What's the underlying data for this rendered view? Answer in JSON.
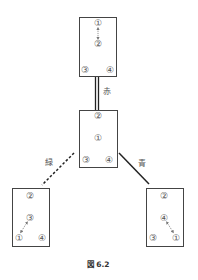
{
  "diagram": {
    "caption": "図 6.2",
    "boxes": {
      "top": {
        "n1": "①",
        "n2": "②",
        "n3": "③",
        "n4": "④"
      },
      "middle": {
        "n1": "①",
        "n2": "②",
        "n3": "③",
        "n4": "④"
      },
      "left": {
        "n1": "①",
        "n2": "②",
        "n3": "③",
        "n4": "④"
      },
      "right": {
        "n1": "①",
        "n2": "②",
        "n3": "③",
        "n4": "④"
      }
    },
    "edges": {
      "top_middle": {
        "label": "赤",
        "style": "double"
      },
      "middle_left": {
        "label": "緑",
        "style": "dashed"
      },
      "middle_right": {
        "label": "青",
        "style": "solid"
      }
    }
  }
}
